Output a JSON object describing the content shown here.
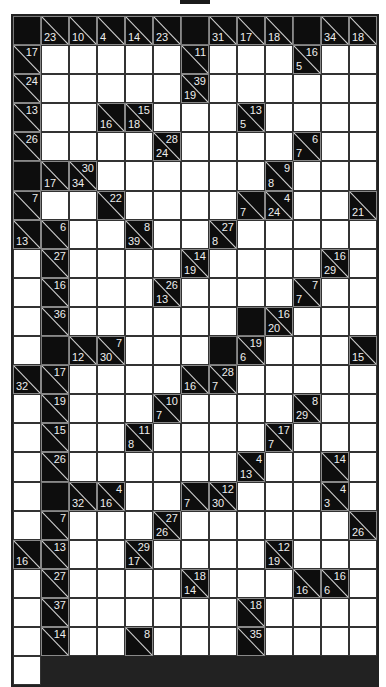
{
  "puzzle": {
    "type": "kakuro",
    "columns": 13,
    "rows": 22,
    "legend": "Each cell: 'B' = solid black block, 'W' = empty white entry cell, [down, right] = clue cell (null if absent)",
    "grid": [
      [
        "B",
        [
          23,
          null
        ],
        [
          10,
          null
        ],
        [
          4,
          null
        ],
        [
          14,
          null
        ],
        [
          23,
          null
        ],
        "B",
        [
          31,
          null
        ],
        [
          17,
          null
        ],
        [
          18,
          null
        ],
        "B",
        [
          34,
          null
        ],
        [
          18,
          null
        ]
      ],
      [
        [
          null,
          17
        ],
        "W",
        "W",
        "W",
        "W",
        "W",
        [
          null,
          11
        ],
        "W",
        "W",
        "W",
        [
          5,
          16
        ],
        "W",
        "W"
      ],
      [
        [
          null,
          24
        ],
        "W",
        "W",
        "W",
        "W",
        "W",
        [
          19,
          39
        ],
        "W",
        "W",
        "W",
        "W",
        "W",
        "W"
      ],
      [
        [
          null,
          13
        ],
        "W",
        "W",
        [
          16,
          null
        ],
        [
          18,
          15
        ],
        "W",
        "W",
        "W",
        [
          5,
          13
        ],
        "W",
        "W",
        "W",
        "W"
      ],
      [
        [
          null,
          26
        ],
        "W",
        "W",
        "W",
        "W",
        [
          24,
          28
        ],
        "W",
        "W",
        "W",
        "W",
        [
          7,
          6
        ],
        "W",
        "W"
      ],
      [
        "B",
        [
          17,
          null
        ],
        [
          34,
          30
        ],
        "W",
        "W",
        "W",
        "W",
        "W",
        "W",
        [
          8,
          9
        ],
        "W",
        "W",
        "W"
      ],
      [
        [
          null,
          7
        ],
        "W",
        "W",
        [
          null,
          22
        ],
        "W",
        "W",
        "W",
        "W",
        [
          7,
          null
        ],
        [
          24,
          4
        ],
        "W",
        "W",
        [
          21,
          null
        ],
        [
          13,
          null
        ]
      ],
      [
        [
          null,
          6
        ],
        "W",
        "W",
        [
          39,
          8
        ],
        "W",
        "W",
        [
          8,
          27
        ],
        "W",
        "W",
        "W",
        "W",
        "W",
        "W"
      ],
      [
        [
          null,
          27
        ],
        "W",
        "W",
        "W",
        "W",
        [
          19,
          14
        ],
        "W",
        "W",
        "W",
        "W",
        [
          29,
          16
        ],
        "W",
        "W"
      ],
      [
        [
          null,
          16
        ],
        "W",
        "W",
        "W",
        [
          13,
          26
        ],
        "W",
        "W",
        "W",
        "W",
        [
          7,
          7
        ],
        "W",
        "W",
        "W"
      ],
      [
        [
          null,
          36
        ],
        "W",
        "W",
        "W",
        "W",
        "W",
        "W",
        "B",
        [
          20,
          16
        ],
        "W",
        "W",
        "W",
        "W"
      ],
      [
        "B",
        [
          12,
          null
        ],
        [
          30,
          7
        ],
        "W",
        "W",
        "W",
        "B",
        [
          6,
          19
        ],
        "W",
        "W",
        "W",
        [
          15,
          null
        ],
        [
          32,
          null
        ]
      ],
      [
        [
          null,
          17
        ],
        "W",
        "W",
        "W",
        "W",
        [
          16,
          null
        ],
        [
          7,
          28
        ],
        "W",
        "W",
        "W",
        "W",
        "W",
        "W"
      ],
      [
        [
          null,
          19
        ],
        "W",
        "W",
        "W",
        [
          7,
          10
        ],
        "W",
        "W",
        "W",
        "W",
        [
          29,
          8
        ],
        "W",
        "W",
        "W"
      ],
      [
        [
          null,
          15
        ],
        "W",
        "W",
        [
          8,
          11
        ],
        "W",
        "W",
        "W",
        "W",
        [
          7,
          17
        ],
        "W",
        "W",
        "W",
        "W"
      ],
      [
        [
          null,
          26
        ],
        "W",
        "W",
        "W",
        "W",
        "W",
        "W",
        [
          13,
          4
        ],
        "W",
        "W",
        [
          null,
          14
        ],
        "W",
        "W"
      ],
      [
        "B",
        [
          32,
          null
        ],
        [
          16,
          4
        ],
        "W",
        "W",
        [
          7,
          null
        ],
        [
          30,
          12
        ],
        "W",
        "W",
        "W",
        [
          3,
          4
        ],
        "W",
        "W"
      ],
      [
        [
          null,
          7
        ],
        "W",
        "W",
        "W",
        [
          26,
          27
        ],
        "W",
        "W",
        "W",
        "W",
        "W",
        "W",
        [
          26,
          null
        ],
        [
          16,
          null
        ]
      ],
      [
        [
          null,
          13
        ],
        "W",
        "W",
        [
          17,
          29
        ],
        "W",
        "W",
        "W",
        "W",
        [
          19,
          12
        ],
        "W",
        "W",
        "W",
        "W"
      ],
      [
        [
          null,
          27
        ],
        "W",
        "W",
        "W",
        "W",
        [
          14,
          18
        ],
        "W",
        "W",
        "W",
        [
          16,
          null
        ],
        [
          6,
          16
        ],
        "W",
        "W"
      ],
      [
        [
          null,
          37
        ],
        "W",
        "W",
        "W",
        "W",
        "W",
        "W",
        [
          null,
          18
        ],
        "W",
        "W",
        "W",
        "W",
        "W"
      ],
      [
        [
          null,
          14
        ],
        "W",
        "W",
        [
          null,
          8
        ],
        "W",
        "W",
        "W",
        [
          null,
          35
        ],
        "W",
        "W",
        "W",
        "W",
        "W"
      ]
    ]
  },
  "colors": {
    "block": "#0d0d0d",
    "entry": "#ffffff",
    "clue_text": "#eeeeee",
    "grid_line": "#333333"
  }
}
